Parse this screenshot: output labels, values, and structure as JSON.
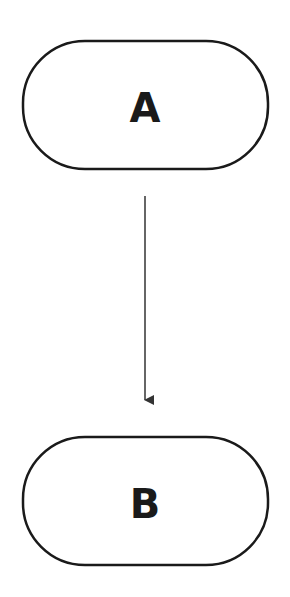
{
  "diagram": {
    "type": "flowchart",
    "nodes": [
      {
        "id": "A",
        "label": "A",
        "shape": "rounded-rectangle"
      },
      {
        "id": "B",
        "label": "B",
        "shape": "rounded-rectangle"
      }
    ],
    "edges": [
      {
        "from": "A",
        "to": "B",
        "style": "arrow"
      }
    ],
    "colors": {
      "stroke": "#1a1a1a",
      "background": "#ffffff"
    }
  }
}
